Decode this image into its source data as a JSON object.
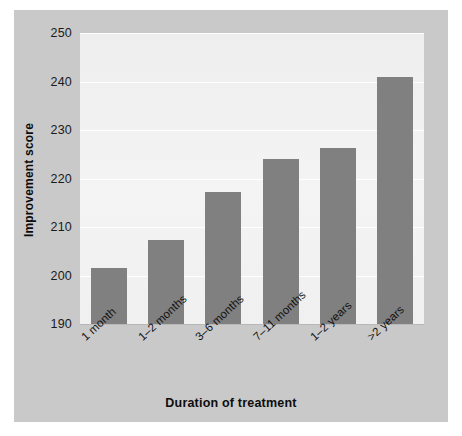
{
  "chart_data": {
    "type": "bar",
    "title": "",
    "xlabel": "Duration of treatment",
    "ylabel": "Improvement score",
    "categories": [
      "1 month",
      "1–2 months",
      "3–6 months",
      "7–11 months",
      "1–2 years",
      ">2 years"
    ],
    "values": [
      201.5,
      207.3,
      217.2,
      224.1,
      226.2,
      241.0
    ],
    "ylim": [
      190,
      250
    ],
    "yticks": [
      250,
      240,
      230,
      220,
      210,
      200,
      190
    ],
    "ytick_labels": [
      "250",
      "240",
      "230",
      "220",
      "210",
      "200",
      "190"
    ],
    "grid": true,
    "grid_axis": "y",
    "legend": null,
    "legend_position": "none",
    "bar_color": "#808080",
    "plot_background": "#f1f1f1",
    "panel_background": "#c9c9c9",
    "gridline_color": "#ffffff",
    "text_color": "#111111",
    "xtick_label_rotation": -43
  },
  "axes": {
    "y_title": "Improvement score",
    "x_title": "Duration of treatment"
  }
}
